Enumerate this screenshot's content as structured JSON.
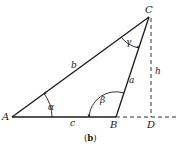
{
  "figure": {
    "caption": "(b)",
    "caption_open": "(",
    "caption_letter": "b",
    "caption_close": ")"
  },
  "vertices": {
    "A": "A",
    "B": "B",
    "C": "C",
    "D": "D"
  },
  "sides": {
    "a": "a",
    "b": "b",
    "c": "c",
    "h": "h"
  },
  "angles": {
    "alpha": "α",
    "beta": "β",
    "gamma": "γ"
  },
  "colors": {
    "line": "#1a1a1a",
    "background": "#ffffff"
  }
}
